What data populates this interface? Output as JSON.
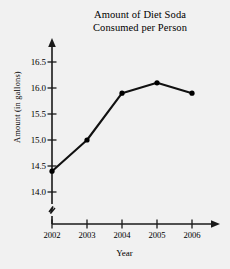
{
  "chart_data": {
    "type": "line",
    "title": "Amount of Diet Soda Consumed per Person",
    "title_lines": [
      "Amount of Diet Soda",
      "Consumed per Person"
    ],
    "xlabel": "Year",
    "ylabel": "Amount (in gallons)",
    "categories": [
      "2002",
      "2003",
      "2004",
      "2005",
      "2006"
    ],
    "x": [
      2002,
      2003,
      2004,
      2005,
      2006
    ],
    "values": [
      14.4,
      15.0,
      15.9,
      16.1,
      15.9
    ],
    "series": [
      {
        "name": "Amount of Diet Soda Consumed per Person",
        "values": [
          14.4,
          15.0,
          15.9,
          16.1,
          15.9
        ]
      }
    ],
    "ylim": [
      14.0,
      16.5
    ],
    "yticks": [
      "14.0",
      "14.5",
      "15.0",
      "15.5",
      "16.0",
      "16.5"
    ],
    "ytick_values": [
      14.0,
      14.5,
      15.0,
      15.5,
      16.0,
      16.5
    ],
    "xticks": [
      "2002",
      "2003",
      "2004",
      "2005",
      "2006"
    ],
    "grid": false,
    "legend": null,
    "legend_position": "none",
    "markers": "filled-circle",
    "axis_break_y": true,
    "axis_break_x": true,
    "axis_arrows": true,
    "line_color": "#000000",
    "marker_color": "#000000",
    "axis_color": "#000000",
    "background_color": "#f1f1f1"
  }
}
